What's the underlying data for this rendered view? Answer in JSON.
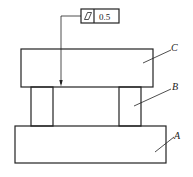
{
  "diagram": {
    "type": "mechanical-assembly-drawing",
    "tolerance_frame": {
      "symbol": "flatness",
      "symbol_icon": "parallelogram-icon",
      "value": "0.5"
    },
    "parts": [
      {
        "label": "C",
        "description": "upper plate"
      },
      {
        "label": "B",
        "description": "support columns"
      },
      {
        "label": "A",
        "description": "base plate"
      }
    ]
  }
}
